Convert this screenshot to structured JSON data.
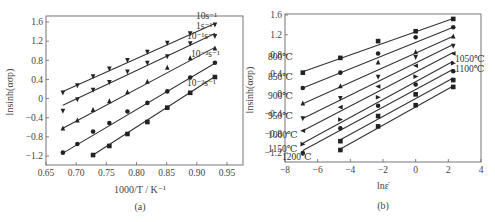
{
  "chart_data": [
    {
      "id": "a",
      "type": "scatter",
      "caption": "(a)",
      "title": "",
      "xlabel": "1000/T / K⁻¹",
      "ylabel": "lnsinh(ασp)",
      "xlim": [
        0.65,
        0.97
      ],
      "ylim": [
        -1.4,
        1.7
      ],
      "xticks": [
        0.65,
        0.7,
        0.75,
        0.8,
        0.85,
        0.9,
        0.95
      ],
      "xtick_labels": [
        "0.65",
        "0.70",
        "0.75",
        "0.80",
        "0.85",
        "0.90",
        "0.95"
      ],
      "yticks": [
        1.6,
        1.2,
        0.8,
        0.4,
        0,
        -0.4,
        -0.8,
        -1.2
      ],
      "ytick_labels": [
        "1.6",
        "1.2",
        "0.8",
        "0.4",
        "0",
        "−0.4",
        "−0.8",
        "−1.2"
      ],
      "grid": false,
      "legend_position": "inline-right",
      "series": [
        {
          "name": "10s⁻¹",
          "marker": "triangle-down",
          "x": [
            0.678,
            0.702,
            0.728,
            0.755,
            0.785,
            0.818,
            0.851,
            0.889,
            0.93
          ],
          "y": [
            0.12,
            0.27,
            0.46,
            0.62,
            0.8,
            0.97,
            1.16,
            1.36,
            1.54
          ],
          "fit": [
            [
              0.678,
              0.15
            ],
            [
              0.93,
              1.57
            ]
          ]
        },
        {
          "name": "1s⁻¹",
          "marker": "triangle-down",
          "x": [
            0.678,
            0.702,
            0.728,
            0.755,
            0.785,
            0.818,
            0.851,
            0.889,
            0.93
          ],
          "y": [
            -0.26,
            -0.02,
            0.18,
            0.34,
            0.56,
            0.74,
            0.88,
            1.15,
            1.3
          ],
          "fit": [
            [
              0.678,
              -0.14
            ],
            [
              0.93,
              1.36
            ]
          ]
        },
        {
          "name": "10⁻¹s⁻¹",
          "marker": "triangle-up",
          "x": [
            0.678,
            0.702,
            0.728,
            0.755,
            0.785,
            0.818,
            0.851,
            0.889,
            0.93
          ],
          "y": [
            -0.62,
            -0.45,
            -0.23,
            -0.05,
            0.14,
            0.36,
            0.65,
            0.85,
            1.05
          ],
          "fit": [
            [
              0.678,
              -0.62
            ],
            [
              0.93,
              1.07
            ]
          ]
        },
        {
          "name": "10⁻²s⁻¹",
          "marker": "circle",
          "x": [
            0.678,
            0.702,
            0.728,
            0.755,
            0.785,
            0.818,
            0.851,
            0.889,
            0.93
          ],
          "y": [
            -1.13,
            -0.95,
            -0.69,
            -0.51,
            -0.27,
            -0.09,
            0.15,
            0.44,
            0.75
          ],
          "fit": [
            [
              0.678,
              -1.14
            ],
            [
              0.93,
              0.74
            ]
          ]
        },
        {
          "name": "10⁻³s⁻¹",
          "marker": "square",
          "x": [
            0.728,
            0.755,
            0.785,
            0.818,
            0.851,
            0.889,
            0.93
          ],
          "y": [
            -1.18,
            -0.99,
            -0.74,
            -0.49,
            -0.19,
            0.12,
            0.45
          ],
          "fit": [
            [
              0.728,
              -1.18
            ],
            [
              0.93,
              0.46
            ]
          ]
        }
      ]
    },
    {
      "id": "b",
      "type": "scatter",
      "caption": "(b)",
      "title": "",
      "xlabel": "lnε̇",
      "ylabel": "lnsinh(ασp)",
      "xlim": [
        -8,
        4
      ],
      "ylim": [
        -1.4,
        1.6
      ],
      "xticks": [
        -8,
        -6,
        -4,
        -2,
        0,
        2,
        4
      ],
      "xtick_labels": [
        "−8",
        "−6",
        "−4",
        "−2",
        "0",
        "2",
        "4"
      ],
      "yticks": [
        1.6,
        1.2,
        0.8,
        0.4,
        0,
        -0.4,
        -0.8,
        -1.2
      ],
      "ytick_labels": [
        "1.6",
        "1.2",
        "0.8",
        "0.4",
        "0",
        "−0.4",
        "−0.8",
        "−1.2"
      ],
      "grid": false,
      "legend_position": "inline",
      "series": [
        {
          "name": "800℃",
          "marker": "square",
          "x": [
            -6.91,
            -4.61,
            -2.3,
            0,
            2.3
          ],
          "y": [
            0.43,
            0.73,
            1.07,
            1.27,
            1.52
          ],
          "fit": [
            [
              -6.91,
              0.45
            ],
            [
              2.3,
              1.53
            ]
          ]
        },
        {
          "name": "850℃",
          "marker": "circle",
          "x": [
            -6.91,
            -4.61,
            -2.3,
            0,
            2.3
          ],
          "y": [
            0.12,
            0.43,
            0.82,
            1.15,
            1.35
          ],
          "fit": [
            [
              -6.91,
              0.12
            ],
            [
              2.3,
              1.35
            ]
          ]
        },
        {
          "name": "900℃",
          "marker": "triangle-up",
          "x": [
            -6.91,
            -4.61,
            -2.3,
            0,
            2.3
          ],
          "y": [
            -0.19,
            0.16,
            0.64,
            0.85,
            1.17
          ],
          "fit": [
            [
              -6.91,
              -0.2
            ],
            [
              2.3,
              1.17
            ]
          ]
        },
        {
          "name": "950℃",
          "marker": "triangle-down",
          "x": [
            -6.91,
            -4.61,
            -2.3,
            0,
            2.3
          ],
          "y": [
            -0.5,
            -0.09,
            0.34,
            0.74,
            0.97
          ],
          "fit": [
            [
              -6.91,
              -0.5
            ],
            [
              2.3,
              1.0
            ]
          ]
        },
        {
          "name": "1000℃",
          "marker": "triangle-left",
          "x": [
            -6.91,
            -4.61,
            -2.3,
            0,
            2.3
          ],
          "y": [
            -0.75,
            -0.27,
            0.15,
            0.57,
            0.82
          ],
          "fit": [
            [
              -6.91,
              -0.75
            ],
            [
              2.3,
              0.84
            ]
          ]
        },
        {
          "name": "1050℃",
          "marker": "triangle-right",
          "x": [
            -6.91,
            -4.61,
            -2.3,
            0,
            2.3
          ],
          "y": [
            -1.02,
            -0.52,
            -0.07,
            0.35,
            0.62
          ],
          "fit": [
            [
              -6.91,
              -1.0
            ],
            [
              2.3,
              0.66
            ]
          ]
        },
        {
          "name": "1100℃",
          "marker": "circle",
          "x": [
            -6.91,
            -4.61,
            -2.3,
            0,
            2.3
          ],
          "y": [
            -1.2,
            -0.7,
            -0.24,
            0.19,
            0.46
          ],
          "fit": [
            [
              -6.91,
              -1.15
            ],
            [
              2.3,
              0.5
            ]
          ]
        },
        {
          "name": "1150℃",
          "marker": "square",
          "x": [
            -4.61,
            -2.3,
            0,
            2.3
          ],
          "y": [
            -0.96,
            -0.45,
            -0.01,
            0.28
          ],
          "fit": [
            [
              -4.61,
              -0.93
            ],
            [
              2.3,
              0.32
            ]
          ]
        },
        {
          "name": "1200℃",
          "marker": "square",
          "x": [
            -4.61,
            -2.3,
            0,
            2.3
          ],
          "y": [
            -1.14,
            -0.66,
            -0.23,
            0.14
          ],
          "fit": [
            [
              -4.61,
              -1.12
            ],
            [
              2.3,
              0.16
            ]
          ]
        }
      ]
    }
  ],
  "figure": {
    "caption_a": "(a)",
    "caption_b": "(b)",
    "xlabel_a": "1000/T / K⁻¹",
    "xlabel_b": "lnε̇",
    "ylabel": "lnsinh(ασp)"
  }
}
